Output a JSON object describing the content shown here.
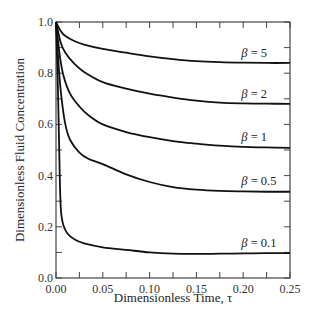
{
  "chart_data": {
    "type": "line",
    "title": "",
    "xlabel": "Dimensionless Time, τ",
    "ylabel": "Dimensionless Fluid Concentration",
    "xlim": [
      0.0,
      0.25
    ],
    "ylim": [
      0.0,
      1.0
    ],
    "grid": false,
    "legend": "inline labels at right end of each curve",
    "x_ticks": [
      "0.00",
      "0.05",
      "0.10",
      "0.15",
      "0.20",
      "0.25"
    ],
    "y_ticks": [
      "0.0",
      "0.2",
      "0.4",
      "0.6",
      "0.8",
      "1.0"
    ],
    "x_minor_step": 0.025,
    "y_minor_step": 0.1,
    "series": [
      {
        "name": "β = 5",
        "x": [
          0.0,
          0.005,
          0.01,
          0.02,
          0.03,
          0.05,
          0.075,
          0.1,
          0.125,
          0.15,
          0.175,
          0.2,
          0.225,
          0.25
        ],
        "values": [
          1.0,
          0.965,
          0.945,
          0.925,
          0.912,
          0.895,
          0.88,
          0.866,
          0.855,
          0.847,
          0.843,
          0.841,
          0.84,
          0.84
        ]
      },
      {
        "name": "β = 2",
        "x": [
          0.0,
          0.005,
          0.01,
          0.02,
          0.03,
          0.05,
          0.075,
          0.1,
          0.125,
          0.15,
          0.175,
          0.2,
          0.225,
          0.25
        ],
        "values": [
          1.0,
          0.92,
          0.88,
          0.835,
          0.805,
          0.765,
          0.74,
          0.72,
          0.705,
          0.693,
          0.685,
          0.682,
          0.681,
          0.68
        ]
      },
      {
        "name": "β = 1",
        "x": [
          0.0,
          0.004,
          0.008,
          0.015,
          0.025,
          0.035,
          0.05,
          0.075,
          0.1,
          0.125,
          0.15,
          0.175,
          0.2,
          0.225,
          0.25
        ],
        "values": [
          1.0,
          0.87,
          0.79,
          0.72,
          0.67,
          0.635,
          0.6,
          0.57,
          0.55,
          0.535,
          0.525,
          0.517,
          0.512,
          0.51,
          0.508
        ]
      },
      {
        "name": "β = 0.5",
        "x": [
          0.0,
          0.003,
          0.006,
          0.01,
          0.015,
          0.025,
          0.035,
          0.05,
          0.075,
          0.1,
          0.125,
          0.15,
          0.175,
          0.2,
          0.225,
          0.25
        ],
        "values": [
          1.0,
          0.82,
          0.7,
          0.6,
          0.54,
          0.49,
          0.465,
          0.445,
          0.405,
          0.375,
          0.355,
          0.345,
          0.34,
          0.338,
          0.337,
          0.337
        ]
      },
      {
        "name": "β = 0.1",
        "x": [
          0.0,
          0.002,
          0.004,
          0.005,
          0.006,
          0.008,
          0.012,
          0.02,
          0.03,
          0.05,
          0.075,
          0.1,
          0.125,
          0.15,
          0.175,
          0.2,
          0.225,
          0.25
        ],
        "values": [
          1.0,
          0.75,
          0.4,
          0.28,
          0.24,
          0.205,
          0.175,
          0.15,
          0.135,
          0.12,
          0.11,
          0.1,
          0.095,
          0.094,
          0.095,
          0.096,
          0.097,
          0.097
        ]
      }
    ],
    "label_positions": [
      {
        "name": "β = 5",
        "x": 0.198,
        "y": 0.865
      },
      {
        "name": "β = 2",
        "x": 0.198,
        "y": 0.705
      },
      {
        "name": "β = 1",
        "x": 0.198,
        "y": 0.535
      },
      {
        "name": "β = 0.5",
        "x": 0.198,
        "y": 0.365
      },
      {
        "name": "β = 0.1",
        "x": 0.198,
        "y": 0.12
      }
    ]
  }
}
